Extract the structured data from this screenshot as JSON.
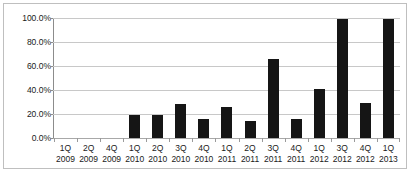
{
  "chart_data": {
    "type": "bar",
    "title": "",
    "subtitle": "",
    "xlabel": "",
    "ylabel": "",
    "grid": true,
    "legend": false,
    "ylim": [
      0,
      100
    ],
    "y_unit": "%",
    "y_ticks": [
      "0.0%",
      "20.0%",
      "40.0%",
      "60.0%",
      "80.0%",
      "100.0%"
    ],
    "y_tick_values": [
      0,
      20,
      40,
      60,
      80,
      100
    ],
    "categories": [
      "1Q 2009",
      "2Q 2009",
      "4Q 2009",
      "1Q 2010",
      "2Q 2010",
      "3Q 2010",
      "4Q 2010",
      "1Q 2011",
      "2Q 2011",
      "3Q 2011",
      "4Q 2011",
      "1Q 2012",
      "3Q 2012",
      "4Q 2012",
      "1Q 2013"
    ],
    "category_parts": [
      {
        "quarter": "1Q",
        "year": "2009"
      },
      {
        "quarter": "2Q",
        "year": "2009"
      },
      {
        "quarter": "4Q",
        "year": "2009"
      },
      {
        "quarter": "1Q",
        "year": "2010"
      },
      {
        "quarter": "2Q",
        "year": "2010"
      },
      {
        "quarter": "3Q",
        "year": "2010"
      },
      {
        "quarter": "4Q",
        "year": "2010"
      },
      {
        "quarter": "1Q",
        "year": "2011"
      },
      {
        "quarter": "2Q",
        "year": "2011"
      },
      {
        "quarter": "3Q",
        "year": "2011"
      },
      {
        "quarter": "4Q",
        "year": "2011"
      },
      {
        "quarter": "1Q",
        "year": "2012"
      },
      {
        "quarter": "3Q",
        "year": "2012"
      },
      {
        "quarter": "4Q",
        "year": "2012"
      },
      {
        "quarter": "1Q",
        "year": "2013"
      }
    ],
    "values": [
      0,
      0,
      0,
      19,
      19.5,
      28.5,
      16,
      25.5,
      14.5,
      65.5,
      16,
      40.5,
      99,
      29.5,
      99
    ],
    "bar_color": "#151515",
    "grid_color": "#c8c8c8",
    "axis_color": "#8c8c8c"
  }
}
